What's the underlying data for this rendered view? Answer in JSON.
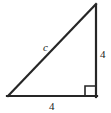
{
  "figure": {
    "type": "right-triangle-diagram",
    "background_color": "#ffffff",
    "stroke_color": "#262626",
    "stroke_width": 2,
    "labels": {
      "hypotenuse": "c",
      "vertical_leg": "4",
      "horizontal_leg": "4"
    },
    "right_angle_marker": {
      "present": true,
      "position": "bottom-right",
      "size": 10
    },
    "geometry": {
      "left_vertex": [
        8,
        96
      ],
      "bottom_right_vertex": [
        96,
        96
      ],
      "top_right_vertex": [
        96,
        4
      ]
    }
  }
}
